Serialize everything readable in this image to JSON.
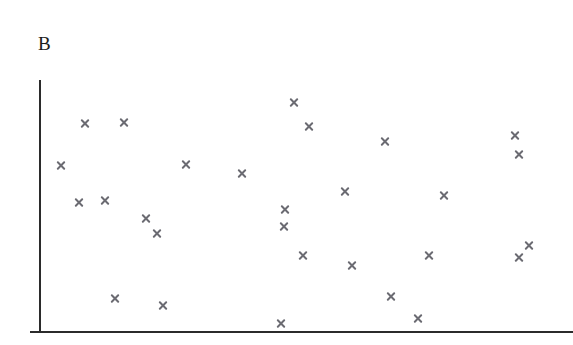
{
  "figure": {
    "panel_label": "B",
    "panel_label_x": 38,
    "panel_label_y": 34,
    "width": 573,
    "height": 345,
    "background_color": "#ffffff",
    "clipped_text_above": "· ·"
  },
  "axes": {
    "axis_color": "#2b2b2b",
    "y_axis": {
      "x": 39,
      "y_top": 80,
      "y_bottom": 332,
      "thickness": 2
    },
    "x_axis": {
      "y": 331,
      "x_left": 30,
      "x_right": 573,
      "thickness": 2
    },
    "origin_tick": {
      "x_left": 30,
      "x_right": 41,
      "y": 331
    },
    "x_tick_labels": [],
    "y_tick_labels": [],
    "xlabel": "",
    "ylabel": "",
    "grid": false
  },
  "chart_data": {
    "type": "scatter",
    "title": "B",
    "xlabel": "",
    "ylabel": "",
    "grid": false,
    "legend": null,
    "marker": {
      "symbol": "x",
      "color": "#6b6b72",
      "size_px": 11,
      "stroke_px": 2
    },
    "n_points": 28,
    "axis_ranges_px": {
      "x": [
        39,
        573
      ],
      "y": [
        80,
        331
      ]
    },
    "note": "Axis tick labels are not rendered in the figure; values below are marker centers in pixel coordinates of the 573x345 image.",
    "points_px": [
      {
        "x": 85,
        "y": 123
      },
      {
        "x": 124,
        "y": 122
      },
      {
        "x": 61,
        "y": 165
      },
      {
        "x": 79,
        "y": 202
      },
      {
        "x": 105,
        "y": 200
      },
      {
        "x": 146,
        "y": 218
      },
      {
        "x": 157,
        "y": 233
      },
      {
        "x": 115,
        "y": 298
      },
      {
        "x": 163,
        "y": 305
      },
      {
        "x": 186,
        "y": 164
      },
      {
        "x": 242,
        "y": 173
      },
      {
        "x": 281,
        "y": 323
      },
      {
        "x": 284,
        "y": 226
      },
      {
        "x": 285,
        "y": 209
      },
      {
        "x": 294,
        "y": 102
      },
      {
        "x": 303,
        "y": 255
      },
      {
        "x": 309,
        "y": 126
      },
      {
        "x": 345,
        "y": 191
      },
      {
        "x": 352,
        "y": 265
      },
      {
        "x": 385,
        "y": 141
      },
      {
        "x": 391,
        "y": 296
      },
      {
        "x": 418,
        "y": 318
      },
      {
        "x": 429,
        "y": 255
      },
      {
        "x": 444,
        "y": 195
      },
      {
        "x": 515,
        "y": 135
      },
      {
        "x": 519,
        "y": 154
      },
      {
        "x": 519,
        "y": 257
      },
      {
        "x": 529,
        "y": 245
      }
    ],
    "x_normalized": [
      0.086,
      0.159,
      0.041,
      0.075,
      0.124,
      0.2,
      0.221,
      0.142,
      0.232,
      0.275,
      0.38,
      0.453,
      0.459,
      0.461,
      0.478,
      0.494,
      0.506,
      0.573,
      0.586,
      0.648,
      0.659,
      0.709,
      0.73,
      0.758,
      0.891,
      0.899,
      0.899,
      0.918
    ],
    "y_normalized": [
      0.829,
      0.833,
      0.661,
      0.514,
      0.522,
      0.45,
      0.39,
      0.131,
      0.104,
      0.665,
      0.629,
      0.032,
      0.418,
      0.486,
      0.912,
      0.303,
      0.817,
      0.558,
      0.263,
      0.757,
      0.139,
      0.052,
      0.303,
      0.542,
      0.781,
      0.705,
      0.295,
      0.343
    ]
  }
}
